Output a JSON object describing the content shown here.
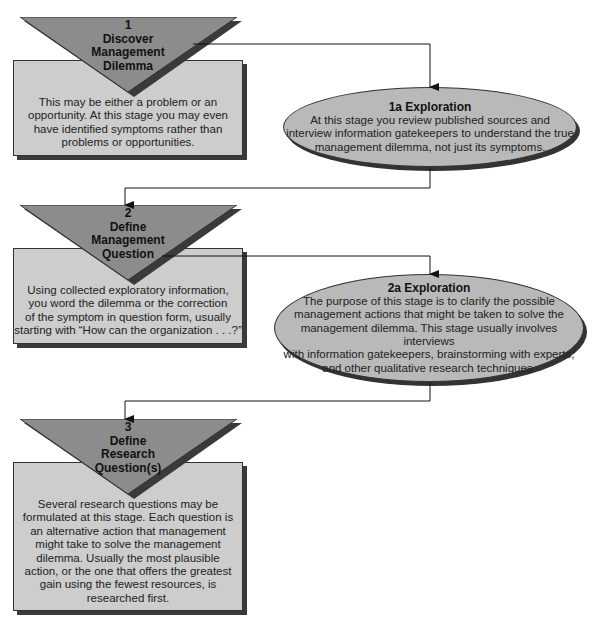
{
  "colors": {
    "box_fill": "#cdcdcd",
    "triangle_fill": "#8c8c8c",
    "ellipse_fill": "#b9b9b9",
    "shadow": "#333333",
    "line": "#111111"
  },
  "steps": [
    {
      "number": "1",
      "title_lines": [
        "Discover",
        "Management",
        "Dilemma"
      ],
      "description_lines": [
        "This may be either a problem or an",
        "opportunity.  At this stage you may even",
        "have identified symptoms rather than",
        "problems or opportunities."
      ]
    },
    {
      "number": "2",
      "title_lines": [
        "Define",
        "Management",
        "Question"
      ],
      "description_lines": [
        "Using collected exploratory information,",
        "you word the dilemma or the correction",
        "of the symptom in question form, usually",
        "starting with “How can the organization . . .?”"
      ]
    },
    {
      "number": "3",
      "title_lines": [
        "Define",
        "Research",
        "Question(s)"
      ],
      "description_lines": [
        "Several research questions may be",
        "formulated at this stage.  Each question is",
        "an alternative action that management",
        "might take to solve the management",
        "dilemma.  Usually the most plausible",
        "action, or the one that offers the greatest",
        "gain using the fewest resources, is",
        "researched first."
      ]
    }
  ],
  "explorations": [
    {
      "title": "1a Exploration",
      "body_lines": [
        "At this stage you review published sources and",
        "interview information gatekeepers to understand the true",
        "management dilemma, not just its symptoms."
      ]
    },
    {
      "title": "2a Exploration",
      "body_lines": [
        "The purpose of this stage is to clarify the possible",
        "management actions that might be taken to solve the",
        "management dilemma.  This stage usually involves interviews",
        "with information gatekeepers, brainstorming with experts,",
        "and other qualitative research techniques."
      ]
    }
  ]
}
